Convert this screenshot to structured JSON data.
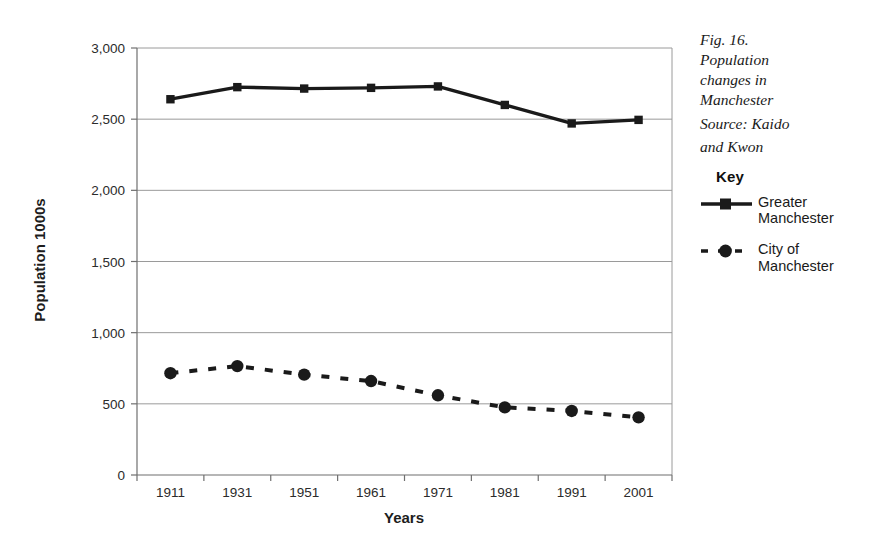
{
  "caption": {
    "lines": [
      "Fig. 16.",
      "Population",
      "changes in",
      "Manchester"
    ],
    "source_lines": [
      "Source: Kaido",
      "and Kwon"
    ]
  },
  "legend": {
    "title": "Key",
    "entries": [
      {
        "name": "greater-manchester",
        "lines": [
          "Greater",
          "Manchester"
        ],
        "style": "solid",
        "marker": "square",
        "color": "#1a1a1a"
      },
      {
        "name": "city-of-manchester",
        "lines": [
          "City of",
          "Manchester"
        ],
        "style": "dashed",
        "marker": "circle",
        "color": "#1a1a1a"
      }
    ]
  },
  "chart_data": {
    "type": "line",
    "title": "",
    "xlabel": "Years",
    "ylabel": "Population 1000s",
    "categories": [
      "1911",
      "1931",
      "1951",
      "1961",
      "1971",
      "1981",
      "1991",
      "2001"
    ],
    "ylim": [
      0,
      3000
    ],
    "yticks": [
      0,
      500,
      1000,
      1500,
      2000,
      2500,
      3000
    ],
    "ytick_labels": [
      "0",
      "500",
      "1,000",
      "1,500",
      "2,000",
      "2,500",
      "3,000"
    ],
    "grid": "horizontal",
    "legend_position": "right-outside",
    "series": [
      {
        "name": "Greater Manchester",
        "style": "solid",
        "marker": "square",
        "color": "#1a1a1a",
        "values": [
          2640,
          2725,
          2715,
          2720,
          2730,
          2600,
          2470,
          2495
        ]
      },
      {
        "name": "City of Manchester",
        "style": "dashed",
        "marker": "circle",
        "color": "#1a1a1a",
        "values": [
          715,
          765,
          705,
          660,
          560,
          475,
          450,
          405
        ]
      }
    ]
  }
}
